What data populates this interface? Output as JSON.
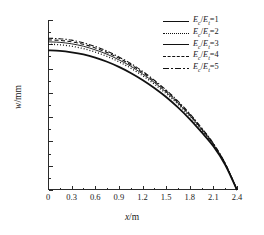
{
  "chart_data": {
    "type": "line",
    "title": "",
    "xlabel": "x/m",
    "ylabel": "w/mm",
    "xlim": [
      0,
      2.4
    ],
    "ylim": [
      0,
      0.7
    ],
    "xticks": [
      "0",
      "0.3",
      "0.6",
      "0.9",
      "1.2",
      "1.5",
      "1.8",
      "2.1",
      "2.4"
    ],
    "xtick_values": [
      0,
      0.3,
      0.6,
      0.9,
      1.2,
      1.5,
      1.8,
      2.1,
      2.4
    ],
    "yticks": [
      "0",
      "0.1",
      "0.2",
      "0.3",
      "0.4",
      "0.5",
      "0.6",
      "0.7"
    ],
    "ytick_values": [
      0,
      0.1,
      0.2,
      0.3,
      0.4,
      0.5,
      0.6,
      0.7
    ],
    "grid": false,
    "legend_position": "top-right",
    "x": [
      0,
      0.15,
      0.3,
      0.45,
      0.6,
      0.75,
      0.9,
      1.05,
      1.2,
      1.35,
      1.5,
      1.65,
      1.8,
      1.95,
      2.1,
      2.25,
      2.4
    ],
    "series": [
      {
        "name": "Ec/Et=1",
        "label_num": "1",
        "style": "solid-thick",
        "values": [
          0.575,
          0.573,
          0.567,
          0.558,
          0.545,
          0.528,
          0.507,
          0.482,
          0.453,
          0.42,
          0.383,
          0.34,
          0.292,
          0.238,
          0.18,
          0.104,
          0.0
        ]
      },
      {
        "name": "Ec/Et=2",
        "label_num": "2",
        "style": "dot",
        "values": [
          0.6,
          0.598,
          0.592,
          0.582,
          0.568,
          0.55,
          0.528,
          0.502,
          0.471,
          0.436,
          0.397,
          0.353,
          0.303,
          0.247,
          0.186,
          0.107,
          0.0
        ]
      },
      {
        "name": "Ec/Et=3",
        "label_num": "3",
        "style": "solid-thin",
        "values": [
          0.61,
          0.608,
          0.602,
          0.592,
          0.577,
          0.559,
          0.536,
          0.51,
          0.478,
          0.443,
          0.403,
          0.358,
          0.307,
          0.25,
          0.188,
          0.108,
          0.0
        ]
      },
      {
        "name": "Ec/Et=4",
        "label_num": "4",
        "style": "dash",
        "values": [
          0.618,
          0.616,
          0.61,
          0.6,
          0.585,
          0.566,
          0.543,
          0.516,
          0.484,
          0.448,
          0.408,
          0.362,
          0.311,
          0.253,
          0.19,
          0.109,
          0.0
        ]
      },
      {
        "name": "Ec/Et=5",
        "label_num": "5",
        "style": "dashdot",
        "values": [
          0.625,
          0.623,
          0.617,
          0.606,
          0.591,
          0.572,
          0.548,
          0.521,
          0.489,
          0.452,
          0.412,
          0.366,
          0.314,
          0.256,
          0.192,
          0.11,
          0.0
        ]
      }
    ]
  },
  "axes": {
    "x_title_var": "x",
    "x_title_unit": "/m",
    "y_title_var": "w",
    "y_title_unit": "/mm"
  },
  "legend": {
    "ratio_numerator": "E",
    "ratio_num_sub": "c",
    "ratio_denominator": "E",
    "ratio_den_sub": "t",
    "separator": "/",
    "equals": "="
  },
  "colors": {
    "line": "#111111",
    "axis": "#2a2a2a",
    "background": "#ffffff"
  }
}
